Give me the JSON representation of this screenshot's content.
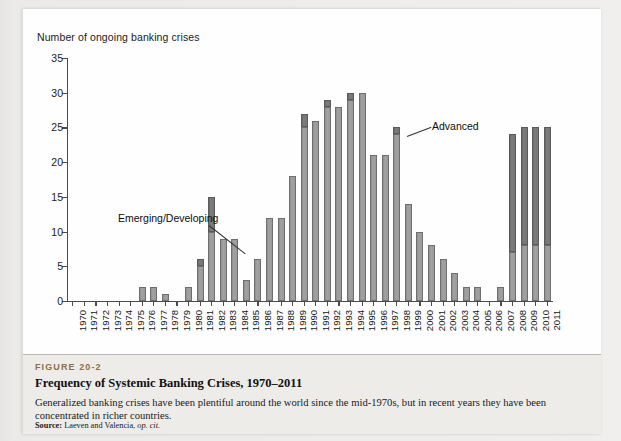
{
  "figure": {
    "number": "FIGURE 20-2",
    "title": "Frequency of Systemic Banking Crises, 1970–2011",
    "description": "Generalized banking crises have been plentiful around the world since the mid-1970s, but in recent years they have been concentrated in richer countries.",
    "source_label": "Source:",
    "source_text": "Laeven and Valencia,",
    "source_italic": "op. cit."
  },
  "colors": {
    "advanced": "#6f6f6f",
    "emerging": "#9a9a9a",
    "axis": "#4c4c4c",
    "caption_bg": "#edece9",
    "fig_number": "#8c6f49"
  },
  "chart_data": {
    "type": "bar",
    "stacked": true,
    "title": "Frequency of Systemic Banking Crises, 1970–2011",
    "xlabel": "",
    "ylabel": "Number of ongoing banking crises",
    "ylim": [
      0,
      35
    ],
    "yticks": [
      0,
      5,
      10,
      15,
      20,
      25,
      30,
      35
    ],
    "grid": false,
    "legend_position": "annotations-inline",
    "annotations": [
      {
        "text": "Emerging/Developing",
        "points_to_year": "1982"
      },
      {
        "text": "Advanced",
        "points_to_year": "1996"
      }
    ],
    "categories": [
      "1970",
      "1971",
      "1972",
      "1973",
      "1974",
      "1975",
      "1976",
      "1977",
      "1978",
      "1979",
      "1980",
      "1981",
      "1982",
      "1983",
      "1984",
      "1985",
      "1986",
      "1987",
      "1988",
      "1989",
      "1990",
      "1991",
      "1992",
      "1993",
      "1994",
      "1995",
      "1996",
      "1997",
      "1998",
      "1999",
      "2000",
      "2001",
      "2002",
      "2003",
      "2004",
      "2005",
      "2006",
      "2007",
      "2008",
      "2009",
      "2010",
      "2011"
    ],
    "series": [
      {
        "name": "Emerging/Developing",
        "values": [
          0,
          0,
          0,
          0,
          0,
          0,
          2,
          2,
          1,
          0,
          2,
          5,
          10,
          9,
          9,
          3,
          6,
          12,
          12,
          18,
          25,
          26,
          28,
          28,
          29,
          30,
          21,
          21,
          24,
          14,
          10,
          8,
          6,
          4,
          2,
          2,
          0,
          2,
          7,
          8,
          8,
          8
        ]
      },
      {
        "name": "Advanced",
        "values": [
          0,
          0,
          0,
          0,
          0,
          0,
          0,
          0,
          0,
          0,
          0,
          1,
          5,
          0,
          0,
          0,
          0,
          0,
          0,
          0,
          2,
          0,
          1,
          0,
          1,
          0,
          0,
          0,
          1,
          0,
          0,
          0,
          0,
          0,
          0,
          0,
          0,
          0,
          17,
          17,
          17,
          17
        ]
      }
    ],
    "totals": [
      0,
      0,
      0,
      0,
      0,
      0,
      2,
      2,
      1,
      0,
      2,
      6,
      15,
      9,
      9,
      3,
      6,
      12,
      12,
      18,
      27,
      26,
      29,
      28,
      30,
      30,
      21,
      21,
      25,
      14,
      10,
      8,
      6,
      4,
      2,
      2,
      0,
      2,
      24,
      25,
      25,
      25
    ]
  }
}
